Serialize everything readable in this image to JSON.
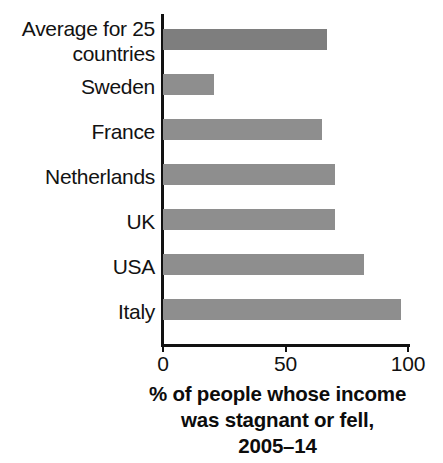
{
  "chart_data": {
    "type": "bar",
    "orientation": "horizontal",
    "title": "",
    "subtitle": "",
    "xlabel": "% of people whose income was stagnant or fell, 2005–14",
    "ylabel": "",
    "categories": [
      "Average for 25 countries",
      "Sweden",
      "France",
      "Netherlands",
      "UK",
      "USA",
      "Italy"
    ],
    "values": [
      67,
      21,
      65,
      70,
      70,
      82,
      97
    ],
    "xlim": [
      0,
      100
    ],
    "xticks": [
      0,
      50,
      100
    ],
    "xtick_labels": [
      "0",
      "50",
      "100"
    ],
    "grid": false,
    "legend": "none",
    "bar_color": "#8e8e8e",
    "accent_bar_color": "#7e7e7e",
    "axis_color": "#111111"
  },
  "axis_title_lines": [
    "% of people whose income",
    "was stagnant or fell,",
    "2005–14"
  ],
  "category_labels": [
    "Average for 25\ncountries",
    "Sweden",
    "France",
    "Netherlands",
    "UK",
    "USA",
    "Italy"
  ]
}
